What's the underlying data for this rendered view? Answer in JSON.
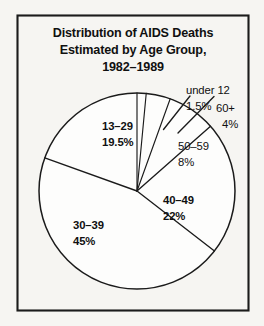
{
  "figure": {
    "background_color": "#f6f5f2",
    "frame_color": "#1b1b1b",
    "ink_color": "#101010"
  },
  "title": {
    "line1": "Distribution of AIDS Deaths",
    "line2": "Estimated by Age Group,",
    "line3": "1982–1989"
  },
  "labels": {
    "under12_name": "under 12",
    "under12_value": "1.5%",
    "sixtyplus_name": "60+",
    "sixtyplus_value": "4%",
    "fifty59_name": "50–59",
    "fifty59_value": "8%",
    "forty49_name": "40–49",
    "forty49_value": "22%",
    "thirty39_name": "30–39",
    "thirty39_value": "45%",
    "thirteen29_name": "13–29",
    "thirteen29_value": "19.5%"
  },
  "chart_data": {
    "type": "pie",
    "title": "Distribution of AIDS Deaths Estimated by Age Group, 1982–1989",
    "subtitle": "",
    "xlabel": "",
    "ylabel": "",
    "grid": false,
    "legend": "none",
    "labels_position": "outside-and-inside",
    "units": "percent",
    "start_angle_deg": 0,
    "direction": "clockwise",
    "center_px": [
      137,
      191
    ],
    "radius_px": 98,
    "categories": [
      "under 12",
      "60+",
      "50–59",
      "40–49",
      "30–39",
      "13–29"
    ],
    "values": [
      1.5,
      4,
      8,
      22,
      45,
      19.5
    ],
    "value_labels": [
      "1.5%",
      "4%",
      "8%",
      "22%",
      "45%",
      "19.5%"
    ],
    "slice_fill": "#fdfdfc",
    "slice_stroke": "#1b1b1b",
    "total": 100,
    "slices": [
      {
        "name": "under 12",
        "value": 1.5,
        "label": "1.5%",
        "start_deg": 0.0,
        "end_deg": 5.4,
        "callout": true
      },
      {
        "name": "60+",
        "value": 4,
        "label": "4%",
        "start_deg": 5.4,
        "end_deg": 19.8,
        "callout": true
      },
      {
        "name": "50–59",
        "value": 8,
        "label": "8%",
        "start_deg": 19.8,
        "end_deg": 48.6,
        "callout": false
      },
      {
        "name": "40–49",
        "value": 22,
        "label": "22%",
        "start_deg": 48.6,
        "end_deg": 127.8,
        "callout": false
      },
      {
        "name": "30–39",
        "value": 45,
        "label": "45%",
        "start_deg": 127.8,
        "end_deg": 289.8,
        "callout": false
      },
      {
        "name": "13–29",
        "value": 19.5,
        "label": "19.5%",
        "start_deg": 289.8,
        "end_deg": 360.0,
        "callout": false
      }
    ]
  }
}
